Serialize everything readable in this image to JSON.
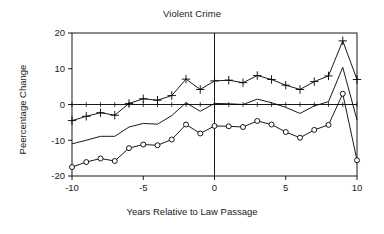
{
  "chart_data": {
    "type": "line",
    "title": "Violent Crime",
    "xlabel": "Years Relative to Law Passage",
    "ylabel": "Peercentage Change",
    "xlim": [
      -10,
      10
    ],
    "ylim": [
      -20,
      20
    ],
    "xticks": [
      -10,
      -5,
      0,
      5,
      10
    ],
    "xtick_labels": [
      "-10",
      "-5",
      "0",
      "5",
      "10"
    ],
    "yticks": [
      -20,
      -10,
      0,
      10,
      20
    ],
    "ytick_labels": [
      "-20",
      "-10",
      "0",
      "10",
      "20"
    ],
    "grid": false,
    "legend": "none",
    "x": [
      -10,
      -9,
      -8,
      -7,
      -6,
      -5,
      -4,
      -3,
      -2,
      -1,
      0,
      1,
      2,
      3,
      4,
      5,
      6,
      7,
      8,
      9,
      10
    ],
    "series": [
      {
        "name": "upper-band",
        "marker": "plus",
        "values": [
          -4.5,
          -3.3,
          -2.3,
          -3.0,
          0.3,
          1.6,
          1.2,
          2.5,
          7.1,
          4.2,
          6.6,
          6.8,
          6.1,
          8.1,
          7.0,
          5.4,
          4.2,
          6.4,
          8.0,
          17.8,
          7.0
        ]
      },
      {
        "name": "point-estimate",
        "marker": "none",
        "values": [
          -11.0,
          -10.0,
          -8.9,
          -8.9,
          -6.3,
          -5.3,
          -5.5,
          -3.1,
          0.5,
          -1.9,
          0.3,
          0.2,
          0.0,
          1.5,
          0.5,
          -0.8,
          -2.5,
          -0.4,
          0.8,
          10.4,
          -4.3
        ]
      },
      {
        "name": "lower-band",
        "marker": "circle",
        "values": [
          -17.5,
          -16.1,
          -15.1,
          -15.8,
          -12.2,
          -11.2,
          -11.4,
          -9.8,
          -5.6,
          -8.1,
          -6.0,
          -6.1,
          -6.3,
          -4.6,
          -5.6,
          -7.7,
          -9.3,
          -7.1,
          -5.7,
          3.0,
          -15.6
        ]
      }
    ],
    "reference_lines": [
      {
        "name": "zero-horizontal",
        "orientation": "horizontal",
        "value": 0
      },
      {
        "name": "law-passage-vertical",
        "orientation": "vertical",
        "value": 0
      }
    ],
    "colors": {
      "line": "#000000",
      "axis": "#000000",
      "text": "#1a1a1a",
      "background": "#ffffff"
    }
  }
}
